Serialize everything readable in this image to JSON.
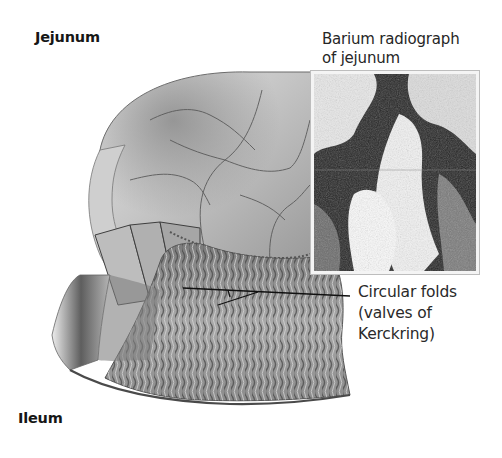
{
  "figure": {
    "sections": {
      "jejunum": {
        "title": "Jejunum"
      },
      "ileum": {
        "title": "Ileum"
      }
    },
    "inset": {
      "caption_line1": "Barium radiograph",
      "caption_line2": "of jejunum"
    },
    "callouts": [
      {
        "line1": "Circular folds",
        "line2": "(valves of",
        "line3": "Kerckring)"
      }
    ],
    "colors": {
      "background": "#ffffff",
      "text": "#1e1e1e",
      "leader_line": "#111111",
      "tissue_light": "#d9d9d9",
      "tissue_dark": "#5a5a5a"
    }
  }
}
